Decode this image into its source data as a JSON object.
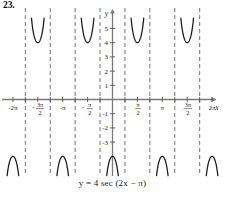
{
  "problem": {
    "number": "23."
  },
  "chart_data": {
    "type": "line",
    "title": "",
    "subtitle": "",
    "equation": "y = 4 sec (2x − π)",
    "equation_parts": {
      "lhs": "y",
      "equals": "=",
      "amplitude": "4",
      "function": "sec",
      "argument": "(2x − π)"
    },
    "xlabel": "x",
    "ylabel": "y",
    "xlim": [
      -7.0686,
      7.0686
    ],
    "ylim": [
      -5.6,
      5.9
    ],
    "grid": false,
    "legend": null,
    "x_tick_labels": [
      {
        "value": -6.2832,
        "text": "-2π",
        "kind": "plain"
      },
      {
        "value": -4.7124,
        "text": "-3π/2",
        "kind": "fraction",
        "numerator": "3π",
        "denominator": "2",
        "sign": "-"
      },
      {
        "value": -3.1416,
        "text": "-π",
        "kind": "plain"
      },
      {
        "value": -1.5708,
        "text": "-π/2",
        "kind": "fraction",
        "numerator": "π",
        "denominator": "2",
        "sign": "-"
      },
      {
        "value": 1.5708,
        "text": "π/2",
        "kind": "fraction",
        "numerator": "π",
        "denominator": "2",
        "sign": ""
      },
      {
        "value": 3.1416,
        "text": "π",
        "kind": "plain"
      },
      {
        "value": 4.7124,
        "text": "3π/2",
        "kind": "fraction",
        "numerator": "3π",
        "denominator": "2",
        "sign": ""
      },
      {
        "value": 6.2832,
        "text": "2π",
        "kind": "plain"
      }
    ],
    "x_minor_ticks": [
      -5.4978,
      -3.927,
      -2.3562,
      -0.7854,
      0.7854,
      2.3562,
      3.927,
      5.4978
    ],
    "y_tick_labels": [
      {
        "value": 5,
        "text": "5"
      },
      {
        "value": 4,
        "text": "4"
      },
      {
        "value": 3,
        "text": "3"
      },
      {
        "value": 2,
        "text": "2"
      },
      {
        "value": 1,
        "text": "1"
      },
      {
        "value": -1,
        "text": "-1"
      },
      {
        "value": -2,
        "text": "-2"
      },
      {
        "value": -3,
        "text": "-3"
      }
    ],
    "asymptotes": [
      -5.4978,
      -3.927,
      -2.3562,
      -0.7854,
      0.7854,
      2.3562,
      3.927,
      5.4978
    ],
    "asymptote_style": "dashed",
    "asymptote_color": "#808080",
    "curve_color": "#1a1a1a",
    "axis_color": "#7a7a7a",
    "period": 3.1416,
    "amplitude": 4,
    "branches": [
      {
        "center": -6.2832,
        "direction": "down",
        "extremum": -4
      },
      {
        "center": -4.7124,
        "direction": "up",
        "extremum": 4
      },
      {
        "center": -3.1416,
        "direction": "down",
        "extremum": -4
      },
      {
        "center": -1.5708,
        "direction": "up",
        "extremum": 4
      },
      {
        "center": 0,
        "direction": "down",
        "extremum": -4
      },
      {
        "center": 1.5708,
        "direction": "up",
        "extremum": 4
      },
      {
        "center": 3.1416,
        "direction": "down",
        "extremum": -4
      },
      {
        "center": 4.7124,
        "direction": "up",
        "extremum": 4
      },
      {
        "center": 6.2832,
        "direction": "down",
        "extremum": -4
      }
    ]
  }
}
